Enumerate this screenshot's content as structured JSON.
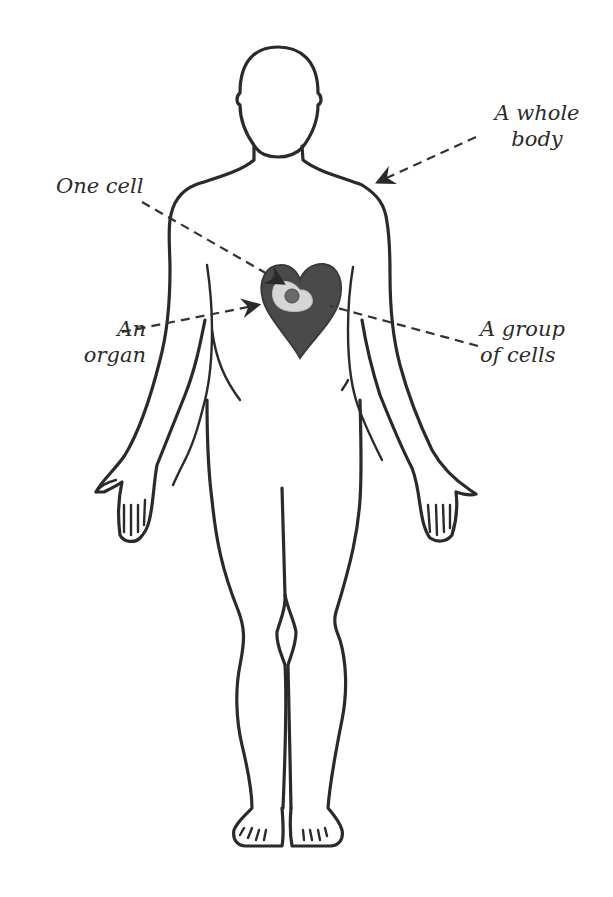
{
  "figure": {
    "labels": {
      "whole_body": {
        "line1": "A whole",
        "line2": "body"
      },
      "one_cell": {
        "line1": "One cell"
      },
      "organ": {
        "line1": "An",
        "line2": "organ"
      },
      "group_of_cells": {
        "line1": "A group",
        "line2": "of cells"
      }
    },
    "colors": {
      "outline": "#2a2a2a",
      "heart_fill": "#4a4a4a",
      "tissue_patch": "#d6d6d6",
      "cell_fill": "#6a6a6a",
      "background": "#ffffff"
    }
  }
}
